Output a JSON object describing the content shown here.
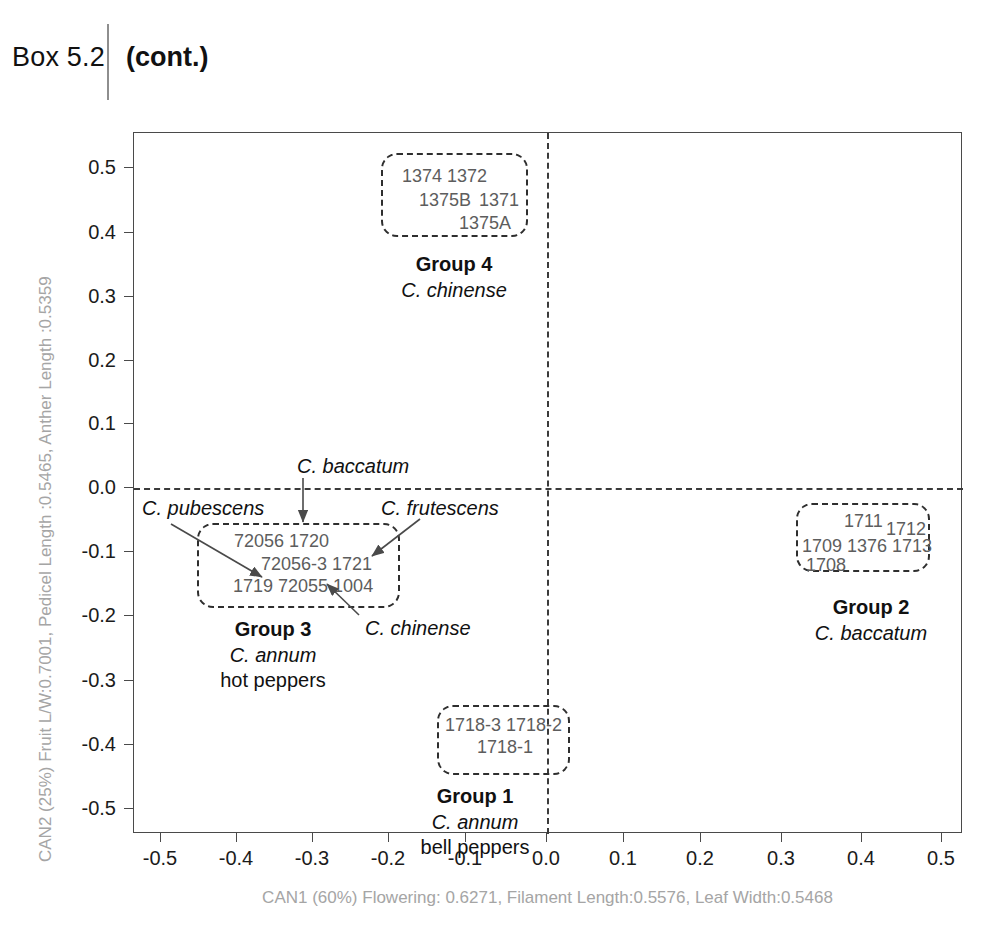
{
  "header": {
    "box_label": "Box 5.2",
    "cont_label": "(cont.)"
  },
  "chart_data": {
    "type": "scatter",
    "title": "",
    "xlabel": "CAN1 (60%) Flowering: 0.6271, Filament Length:0.5576, Leaf Width:0.5468",
    "ylabel": "CAN2 (25%) Fruit L/W:0.7001, Pedicel Length :0.5465, Anther Length :0.5359",
    "xlim": [
      -0.55,
      0.55
    ],
    "ylim": [
      -0.55,
      0.55
    ],
    "grid": false,
    "legend": "none",
    "xticks": [
      "-0.5",
      "-0.4",
      "-0.3",
      "-0.2",
      "-0.1",
      "0.0",
      "0.1",
      "0.2",
      "0.3",
      "0.4",
      "0.5"
    ],
    "xtick_values": [
      -0.5,
      -0.4,
      -0.3,
      -0.2,
      -0.1,
      0.0,
      0.1,
      0.2,
      0.3,
      0.4,
      0.5
    ],
    "yticks": [
      "0.5",
      "0.4",
      "0.3",
      "0.2",
      "0.1",
      "0.0",
      "-0.1",
      "-0.2",
      "-0.3",
      "-0.4",
      "-0.5"
    ],
    "ytick_values": [
      0.5,
      0.4,
      0.3,
      0.2,
      0.1,
      0.0,
      -0.1,
      -0.2,
      -0.3,
      -0.4,
      -0.5
    ],
    "reference_lines": [
      {
        "axis": "x",
        "value": 0.0,
        "style": "dashed"
      },
      {
        "axis": "y",
        "value": 0.0,
        "style": "dashed"
      }
    ],
    "clusters": [
      {
        "id": "group4",
        "title": "Group 4",
        "species": "C. chinense",
        "subtitle": "",
        "center": [
          -0.195,
          0.445
        ],
        "accessions": [
          "1374",
          "1372",
          "1375B",
          "1371",
          "1375A"
        ]
      },
      {
        "id": "group2",
        "title": "Group 2",
        "species": "C. baccatum",
        "subtitle": "",
        "center": [
          0.385,
          -0.085
        ],
        "accessions": [
          "1711",
          "1712",
          "1709",
          "1376",
          "1713",
          "1708"
        ]
      },
      {
        "id": "group3",
        "title": "Group 3",
        "species": "C. annum",
        "subtitle": "hot peppers",
        "center": [
          -0.315,
          -0.125
        ],
        "accessions": [
          "72056",
          "1720",
          "72056-3",
          "1721",
          "1719",
          "72055",
          "1004"
        ]
      },
      {
        "id": "group1",
        "title": "Group 1",
        "species": "C. annum",
        "subtitle": "bell peppers",
        "center": [
          -0.105,
          -0.36
        ],
        "accessions": [
          "1718-3",
          "1718-2",
          "1718-1"
        ]
      }
    ],
    "annotations": [
      {
        "id": "ann-baccatum",
        "text": "C. baccatum",
        "points_to": "72056 / 1720 row"
      },
      {
        "id": "ann-pubescens",
        "text": "C. pubescens",
        "points_to": "1719"
      },
      {
        "id": "ann-frutescens",
        "text": "C. frutescens",
        "points_to": "1721"
      },
      {
        "id": "ann-chinense",
        "text": "C. chinense",
        "points_to": "1004"
      }
    ]
  },
  "axes": {
    "xticks": [
      {
        "label": "-0.5",
        "left": 160
      },
      {
        "label": "-0.4",
        "left": 236
      },
      {
        "label": "-0.3",
        "left": 312
      },
      {
        "label": "-0.2",
        "left": 388
      },
      {
        "label": "-0.1",
        "left": 465
      },
      {
        "label": "0.0",
        "left": 546
      },
      {
        "label": "0.1",
        "left": 623
      },
      {
        "label": "0.2",
        "left": 700
      },
      {
        "label": "0.3",
        "left": 781
      },
      {
        "label": "0.4",
        "left": 861
      },
      {
        "label": "0.5",
        "left": 941
      }
    ],
    "yticks": [
      {
        "label": "0.5",
        "top": 167
      },
      {
        "label": "0.4",
        "top": 232
      },
      {
        "label": "0.3",
        "top": 296
      },
      {
        "label": "0.2",
        "top": 360
      },
      {
        "label": "0.1",
        "top": 423
      },
      {
        "label": "0.0",
        "top": 487
      },
      {
        "label": "-0.1",
        "top": 551
      },
      {
        "label": "-0.2",
        "top": 615
      },
      {
        "label": "-0.3",
        "top": 680
      },
      {
        "label": "-0.4",
        "top": 744
      },
      {
        "label": "-0.5",
        "top": 808
      }
    ]
  },
  "labels": {
    "g4_acc_1": "1374 1372",
    "g4_acc_2": "1375B",
    "g4_acc_3": "1371",
    "g4_acc_4": "1375A",
    "g4_title": "Group 4",
    "g4_species": "C. chinense",
    "g2_acc_1": "1711",
    "g2_acc_2": "1712",
    "g2_acc_3": "1709 1376 1713",
    "g2_acc_4": "1708",
    "g2_title": "Group 2",
    "g2_species": "C. baccatum",
    "g3_acc_1": "72056  1720",
    "g3_acc_2": "72056-3 1721",
    "g3_acc_3": "1719  72055 1004",
    "g3_title": "Group 3",
    "g3_species": "C. annum",
    "g3_sub": "hot peppers",
    "g1_acc_1": "1718-3 1718-2",
    "g1_acc_2": "1718-1",
    "g1_title": "Group 1",
    "g1_species": "C. annum",
    "g1_sub": "bell peppers",
    "ann_baccatum": "C. baccatum",
    "ann_pubescens": "C. pubescens",
    "ann_frutescens": "C. frutescens",
    "ann_chinense": "C. chinense"
  }
}
